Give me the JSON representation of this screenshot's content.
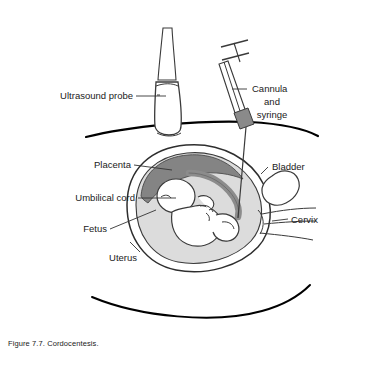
{
  "figure": {
    "caption": "Figure 7.7. Cordocentesis.",
    "background_color": "#ffffff"
  },
  "colors": {
    "outline": "#000000",
    "organ_outline": "#3a3a3a",
    "placenta_fill": "#848484",
    "amniotic_fill": "#dcdcdc",
    "uterus_wall_fill": "#ffffff",
    "fetus_fill": "#ffffff",
    "cord_fill": "#8c8c8c",
    "syringe_hub_fill": "#8a8a8a",
    "label_text": "#1a1a1a",
    "leader_line": "#333333"
  },
  "labels": {
    "ultrasound_probe": "Ultrasound probe",
    "cannula_line1": "Cannula",
    "cannula_line2": "and",
    "cannula_line3": "syringe",
    "placenta": "Placenta",
    "umbilical_cord": "Umbilical cord",
    "fetus": "Fetus",
    "uterus": "Uterus",
    "bladder": "Bladder",
    "cervix": "Cervix"
  },
  "structures": [
    {
      "name": "ultrasound-probe",
      "label": "Ultrasound probe"
    },
    {
      "name": "cannula-and-syringe",
      "label": "Cannula and syringe"
    },
    {
      "name": "placenta",
      "label": "Placenta"
    },
    {
      "name": "umbilical-cord",
      "label": "Umbilical cord"
    },
    {
      "name": "fetus",
      "label": "Fetus"
    },
    {
      "name": "uterus",
      "label": "Uterus"
    },
    {
      "name": "bladder",
      "label": "Bladder"
    },
    {
      "name": "cervix",
      "label": "Cervix"
    }
  ]
}
